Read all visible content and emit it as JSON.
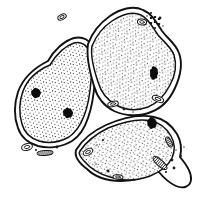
{
  "image": {
    "title": "Three adjacent cells line drawing",
    "style": "black ink stipple engraving",
    "background_color": "#ffffff",
    "ink_color": "#111111",
    "width": 199,
    "height": 201
  },
  "palette": {
    "background": "#ffffff",
    "outline": "#111111",
    "stipple": "#2a2a2a",
    "nucleus": "#0c0c0c",
    "membrane_inner": "#111111"
  },
  "cells": [
    {
      "id": "cell-left",
      "label": "Left cell",
      "outline": "M 48 61 C 54 50, 64 41, 74 38 C 83 36, 90 40, 93 48 C 97 58, 96 70, 95 80 C 94 93, 92 107, 88 118 C 85 127, 80 136, 72 141 C 62 147, 49 149, 38 146 C 28 143, 21 137, 18 128 C 14 117, 14 104, 18 92 C 23 78, 34 68, 48 61 Z",
      "inner_outline": "M 50 65 C 56 55, 65 46, 74 43 C 81 41, 87 45, 90 52 C 93 61, 92 72, 91 81 C 90 94, 88 106, 84 116 C 81 124, 76 132, 69 137 C 60 142, 49 144, 39 141 C 30 138, 24 132, 22 124 C 19 114, 19 102, 23 91 C 28 78, 38 70, 50 65 Z",
      "fill_pattern": "stipple-dense",
      "nuclei": [
        {
          "cx": 36,
          "cy": 93,
          "rx": 4.4,
          "ry": 4.2,
          "rotate": -18
        },
        {
          "cx": 68,
          "cy": 113,
          "rx": 4.6,
          "ry": 4.4,
          "rotate": 14
        }
      ],
      "organelles": [
        {
          "type": "vesicle",
          "cx": 27,
          "cy": 147,
          "rx": 5.5,
          "ry": 3.4,
          "rotate": -14
        },
        {
          "type": "rod",
          "cx": 45,
          "cy": 153,
          "rx": 8.0,
          "ry": 2.4,
          "rotate": -4
        },
        {
          "type": "vesicle",
          "cx": 62,
          "cy": 17,
          "rx": 4.5,
          "ry": 2.6,
          "rotate": -26
        }
      ]
    },
    {
      "id": "cell-top-right",
      "label": "Top-right cell",
      "outline": "M 88 44 C 92 33, 100 23, 110 16 C 120 9, 133 5, 143 10 C 153 14, 157 24, 162 31 C 168 39, 176 44, 179 53 C 183 64, 180 77, 175 88 C 170 99, 162 108, 151 112 C 139 117, 125 116, 114 111 C 104 106, 97 97, 94 86 C 90 73, 86 57, 88 44 Z",
      "inner_outline": "M 92 46 C 96 36, 103 27, 112 21 C 121 15, 132 11, 141 15 C 149 19, 153 28, 158 35 C 164 42, 171 47, 174 55 C 177 65, 175 76, 170 85 C 165 95, 158 103, 148 107 C 137 111, 125 110, 116 105 C 107 100, 101 92, 98 82 C 94 70, 90 57, 92 46 Z",
      "fill_pattern": "stipple-dense",
      "nuclei": [
        {
          "cx": 154,
          "cy": 73,
          "rx": 3.6,
          "ry": 6.0,
          "rotate": 8
        }
      ],
      "organelles": [
        {
          "type": "vesicle",
          "cx": 142,
          "cy": 22,
          "rx": 4.6,
          "ry": 3.0,
          "rotate": 8
        },
        {
          "type": "granule-cluster",
          "cx": 155,
          "cy": 21,
          "count": 6
        },
        {
          "type": "vesicle",
          "cx": 158,
          "cy": 99,
          "rx": 6.0,
          "ry": 2.8,
          "rotate": 22
        },
        {
          "type": "vesicle",
          "cx": 113,
          "cy": 104,
          "rx": 5.4,
          "ry": 2.6,
          "rotate": -12
        }
      ]
    },
    {
      "id": "cell-bottom-right",
      "label": "Bottom-right cell",
      "outline": "M 76 150 C 82 140, 93 131, 106 125 C 122 118, 140 114, 154 117 C 165 119, 172 126, 177 134 C 181 141, 182 149, 180 157 C 186 164, 192 172, 191 180 C 190 187, 183 189, 176 186 C 169 183, 163 177, 158 171 C 147 177, 134 181, 121 181 C 108 181, 95 177, 87 169 C 79 163, 74 157, 76 150 Z",
      "inner_outline": "M 80 151 C 86 142, 96 134, 108 128 C 123 122, 139 118, 151 121 C 161 123, 167 129, 171 136 C 175 143, 175 151, 172 158 C 168 166, 160 172, 150 176 C 137 181, 122 181, 110 177 C 99 174, 90 168, 84 161 C 80 157, 78 154, 80 151 Z",
      "fill_pattern": "stipple-dense",
      "nuclei": [
        {
          "cx": 152,
          "cy": 123,
          "rx": 4.4,
          "ry": 5.0,
          "rotate": -10
        }
      ],
      "organelles": [
        {
          "type": "rod",
          "cx": 169,
          "cy": 142,
          "rx": 5.5,
          "ry": 2.4,
          "rotate": 62
        },
        {
          "type": "hatched-rod",
          "cx": 160,
          "cy": 163,
          "rx": 9.0,
          "ry": 3.2,
          "rotate": 42
        },
        {
          "type": "vesicle",
          "cx": 88,
          "cy": 152,
          "rx": 5.2,
          "ry": 3.0,
          "rotate": -30
        },
        {
          "type": "vesicle",
          "cx": 118,
          "cy": 177,
          "rx": 5.0,
          "ry": 2.2,
          "rotate": 4
        }
      ]
    }
  ],
  "annotations": {
    "junction_note": "Three cell membranes meet at a tri-junction near the center-left",
    "tail_note": "Bottom-right cell has a pointed cytoplasmic tail extending toward lower-right corner"
  }
}
